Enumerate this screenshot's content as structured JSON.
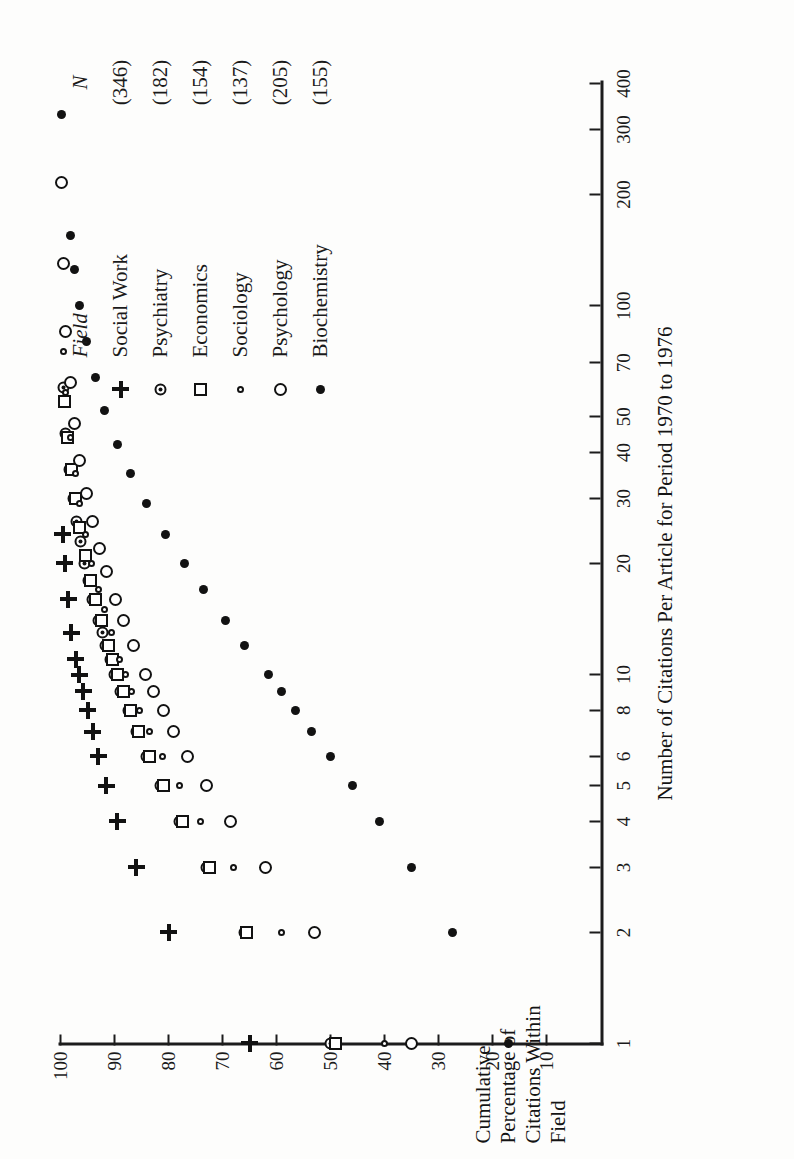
{
  "figure": {
    "orientation": "rotated-90-ccw",
    "background": "#fdfdfc",
    "ink": "#121212"
  },
  "chart_data": {
    "type": "scatter",
    "title": "",
    "xlabel": "Number of Citations Per Article for Period 1970 to 1976",
    "ylabel": "Cumulative Percentage of Citations Within Field",
    "xscale": "log",
    "yscale": "linear",
    "xlim": [
      1,
      400
    ],
    "ylim": [
      0,
      100
    ],
    "grid": false,
    "legend_position": "right",
    "legend_headers": {
      "field": "Field",
      "n": "N"
    },
    "xticks": [
      1,
      2,
      3,
      4,
      5,
      6,
      8,
      10,
      20,
      30,
      40,
      50,
      70,
      100,
      200,
      300,
      400
    ],
    "xticklabels": [
      "1",
      "2",
      "3",
      "4",
      "5",
      "6",
      "8",
      "10",
      "20",
      "30",
      "40",
      "50",
      "70",
      "100",
      "200",
      "300",
      "400"
    ],
    "yticks": [
      10,
      20,
      30,
      40,
      50,
      60,
      70,
      80,
      90,
      100
    ],
    "yticklabels": [
      "10",
      "20",
      "30",
      "40",
      "50",
      "60",
      "70",
      "80",
      "90",
      "100"
    ],
    "series": [
      {
        "name": "Social Work",
        "n": "(346)",
        "n_value": 346,
        "marker": "plus",
        "marker_label": "+",
        "x": [
          1,
          2,
          3,
          4,
          5,
          6,
          7,
          8,
          9,
          10,
          11,
          13,
          16,
          20,
          24
        ],
        "y": [
          65,
          80,
          86,
          89.5,
          91.5,
          93,
          94,
          95,
          95.8,
          96.5,
          97.2,
          98,
          98.6,
          99.2,
          99.6
        ]
      },
      {
        "name": "Psychiatry",
        "n": "(182)",
        "n_value": 182,
        "marker": "bullseye",
        "marker_label": "circle-with-dot",
        "x": [
          1,
          2,
          3,
          4,
          5,
          6,
          7,
          8,
          9,
          10,
          11,
          12,
          13,
          14,
          16,
          18,
          20,
          23,
          26,
          30,
          36,
          45,
          60
        ],
        "y": [
          50,
          66,
          73,
          78,
          81.5,
          84,
          86,
          87.5,
          88.8,
          90,
          90.8,
          91.6,
          92.3,
          93,
          94,
          94.8,
          95.5,
          96.3,
          97,
          97.6,
          98.3,
          99,
          99.5
        ]
      },
      {
        "name": "Economics",
        "n": "(154)",
        "n_value": 154,
        "marker": "square",
        "marker_label": "open-square",
        "x": [
          1,
          2,
          3,
          4,
          5,
          6,
          7,
          8,
          9,
          10,
          11,
          12,
          14,
          16,
          18,
          21,
          25,
          30,
          36,
          44,
          55
        ],
        "y": [
          49,
          65.5,
          72.5,
          77.5,
          81,
          83.5,
          85.5,
          87,
          88.3,
          89.5,
          90.4,
          91.2,
          92.5,
          93.6,
          94.5,
          95.4,
          96.4,
          97.2,
          98,
          98.7,
          99.3
        ]
      },
      {
        "name": "Sociology",
        "n": "(137)",
        "n_value": 137,
        "marker": "small-circle",
        "marker_label": "small-open-circle",
        "x": [
          1,
          2,
          3,
          4,
          5,
          6,
          7,
          8,
          9,
          10,
          11,
          13,
          15,
          17,
          20,
          24,
          29,
          35,
          44,
          58,
          75
        ],
        "y": [
          40,
          59,
          68,
          74,
          78,
          81.2,
          83.5,
          85.3,
          86.8,
          88,
          89,
          90.6,
          91.9,
          93,
          94.2,
          95.4,
          96.4,
          97.3,
          98.2,
          99,
          99.5
        ]
      },
      {
        "name": "Psychology",
        "n": "(205)",
        "n_value": 205,
        "marker": "circle",
        "marker_label": "open-circle",
        "x": [
          1,
          2,
          3,
          4,
          5,
          6,
          7,
          8,
          9,
          10,
          12,
          14,
          16,
          19,
          22,
          26,
          31,
          38,
          48,
          62,
          85,
          130,
          215
        ],
        "y": [
          35,
          53,
          62,
          68.5,
          73,
          76.5,
          79,
          81,
          82.8,
          84.2,
          86.5,
          88.3,
          89.8,
          91.4,
          92.7,
          94,
          95.2,
          96.4,
          97.4,
          98.2,
          99,
          99.5,
          99.9
        ]
      },
      {
        "name": "Biochemistry",
        "n": "(155)",
        "n_value": 155,
        "marker": "dot",
        "marker_label": "filled-dot",
        "x": [
          1,
          2,
          3,
          4,
          5,
          6,
          7,
          8,
          9,
          10,
          12,
          14,
          17,
          20,
          24,
          29,
          35,
          42,
          52,
          64,
          80,
          100,
          125,
          155,
          330
        ],
        "y": [
          17,
          27.5,
          35,
          41,
          46,
          50,
          53.5,
          56.5,
          59,
          61.5,
          66,
          69.5,
          73.5,
          77,
          80.5,
          84,
          87,
          89.5,
          91.8,
          93.6,
          95.2,
          96.4,
          97.4,
          98.2,
          99.8
        ]
      }
    ]
  }
}
